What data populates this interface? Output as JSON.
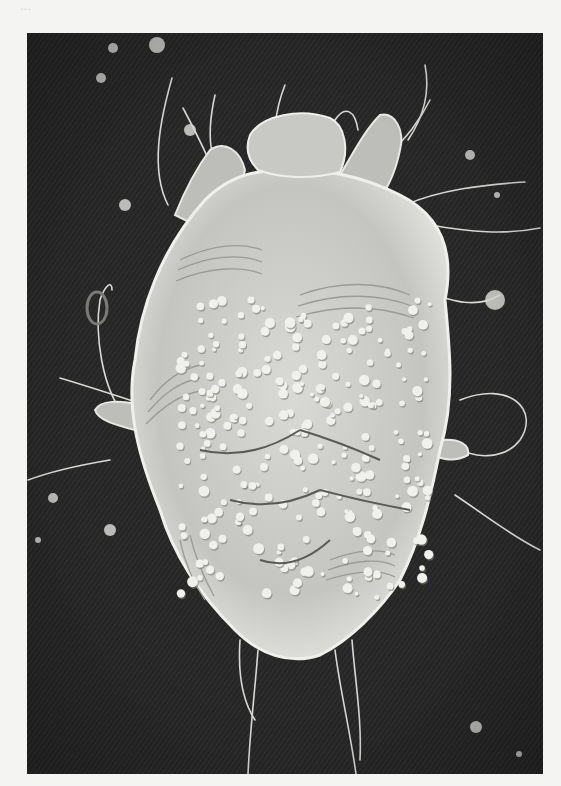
{
  "page": {
    "background": "#f4f4f2",
    "bleed_through_text": "..."
  },
  "photo": {
    "kind": "scanning-electron-micrograph",
    "subject": "mite (dorsal view)",
    "frame": {
      "x": 27,
      "y": 33,
      "width": 516,
      "height": 741
    },
    "background_color": "#262626",
    "body_color": "#cfcfcb",
    "highlight_color": "#ececE8",
    "shadow_color": "#8f8f8b",
    "seta_color": "#d8d8d4"
  },
  "body": {
    "outline": "M205,200 C230,175 260,168 290,172 C320,168 360,175 400,195 C440,215 455,250 445,300 C450,350 455,400 440,450 C430,500 420,540 400,580 C380,610 350,640 320,655 C290,665 260,655 235,630 C205,600 175,560 160,510 C140,460 125,410 135,360 C140,310 160,250 205,200 Z",
    "gnathosoma": "M250,135 C262,115 300,108 330,118 C345,125 350,150 340,172 C310,180 280,178 258,170 C248,160 245,148 250,135 Z",
    "leg_left_1": "M175,215 C185,190 195,170 210,150 C225,140 240,150 245,170 C240,195 225,215 205,230 Z",
    "leg_right_1": "M340,175 C355,150 365,130 380,115 C395,112 405,130 400,150 C395,175 385,195 370,210 Z",
    "leg_left_2": "M135,430 C115,425 98,420 95,410 C100,400 120,400 140,405 Z",
    "leg_right_2": "M440,440 C460,438 470,445 468,455 C455,462 445,460 432,455 Z"
  },
  "striations": [
    "M180,260 C210,245 240,242 262,250",
    "M178,270 C208,256 240,253 262,262",
    "M176,281 C206,268 240,265 262,274",
    "M300,295 C340,280 380,282 410,295",
    "M298,306 C340,292 380,294 412,306",
    "M296,317 C340,304 380,306 414,318",
    "M150,400 C165,380 180,370 200,365",
    "M148,412 C165,392 180,382 200,378",
    "M146,424 C165,405 180,395 200,391",
    "M330,560 C355,550 380,548 395,555",
    "M328,570 C355,560 380,558 395,566",
    "M326,580 C355,571 380,569 395,577",
    "M180,540 C185,565 195,585 205,600",
    "M190,535 C196,560 205,580 214,596"
  ],
  "setae": [
    "M172,78 C160,120 150,170 168,205",
    "M183,108 C200,140 215,170 230,215",
    "M215,95 C205,140 210,170 235,185",
    "M285,85 C275,110 272,140 275,170",
    "M335,120 C345,105 355,110 358,130",
    "M425,65 C430,90 425,115 408,140",
    "M430,100 C420,120 405,140 392,150",
    "M405,205 C440,190 480,185 525,182",
    "M430,225 C470,232 505,235 540,228",
    "M420,290 C450,300 475,310 500,295",
    "M460,400 C510,380 540,410 520,440 C505,460 470,460 455,445",
    "M455,495 C485,515 510,535 540,550",
    "M128,420 C100,390 95,330 100,300 C105,285 112,280 112,290",
    "M160,410 C130,400 100,390 60,378",
    "M110,460 C80,465 55,470 28,480",
    "M240,640 C238,670 242,700 255,720",
    "M258,650 C255,690 250,730 248,774",
    "M335,650 C340,690 350,730 356,774",
    "M352,640 C355,680 362,720 360,760",
    "M155,430 C165,440 175,445 188,450"
  ],
  "debris": [
    {
      "x": 157,
      "y": 45,
      "r": 8
    },
    {
      "x": 113,
      "y": 48,
      "r": 5
    },
    {
      "x": 101,
      "y": 78,
      "r": 5
    },
    {
      "x": 125,
      "y": 205,
      "r": 6
    },
    {
      "x": 190,
      "y": 130,
      "r": 6
    },
    {
      "x": 470,
      "y": 155,
      "r": 5
    },
    {
      "x": 495,
      "y": 300,
      "r": 10
    },
    {
      "x": 53,
      "y": 498,
      "r": 5
    },
    {
      "x": 110,
      "y": 530,
      "r": 6
    },
    {
      "x": 38,
      "y": 540,
      "r": 3
    },
    {
      "x": 476,
      "y": 727,
      "r": 6
    },
    {
      "x": 519,
      "y": 754,
      "r": 3
    },
    {
      "x": 497,
      "y": 195,
      "r": 3
    }
  ],
  "ring_particle": {
    "cx": 97,
    "cy": 308,
    "rx": 10,
    "ry": 16
  },
  "tubercles_seed": 7,
  "tubercle_region": {
    "x": 180,
    "y": 300,
    "w": 250,
    "h": 300
  }
}
